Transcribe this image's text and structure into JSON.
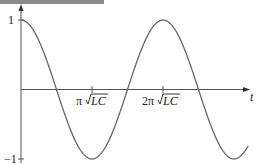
{
  "chart_data": {
    "type": "line",
    "title": "",
    "xlabel": "t",
    "ylabel": "",
    "function": "cos(t / sqrt(LC))",
    "x_ticks": [
      {
        "label": "π√LC",
        "value_in_units_of_pi_sqrtLC": 1
      },
      {
        "label": "2π√LC",
        "value_in_units_of_pi_sqrtLC": 2
      }
    ],
    "y_ticks": [
      {
        "label": "1",
        "value": 1
      },
      {
        "label": "−1",
        "value": -1
      }
    ],
    "ylim": [
      -1,
      1
    ],
    "xlim_in_units_of_pi_sqrtLC": [
      0,
      3.2
    ],
    "grid": false,
    "series": [
      {
        "name": "cos(t/√LC)",
        "x_in_units_of_pi_sqrtLC": [
          0,
          0.25,
          0.5,
          0.75,
          1.0,
          1.25,
          1.5,
          1.75,
          2.0,
          2.25,
          2.5,
          2.75,
          3.0,
          3.2
        ],
        "values": [
          1,
          0.707,
          0,
          -0.707,
          -1,
          -0.707,
          0,
          0.707,
          1,
          0.707,
          0,
          -0.707,
          -1,
          -0.81
        ]
      }
    ]
  },
  "labels": {
    "y_max": "1",
    "y_min": "−1",
    "x_axis": "t",
    "tick1_pi": "π",
    "tick1_root": "LC",
    "tick2_pi": "2π",
    "tick2_root": "LC"
  }
}
